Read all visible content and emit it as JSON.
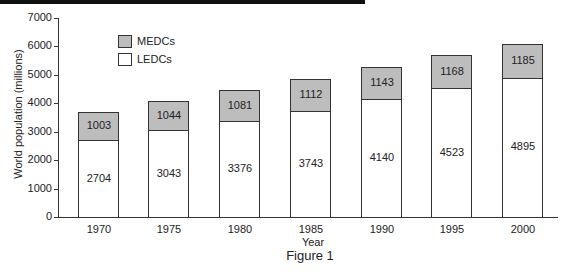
{
  "chart_data": {
    "type": "bar",
    "stacked": true,
    "title": "Figure 1",
    "xlabel": "Year",
    "ylabel": "World population (millions)",
    "ylim": [
      0,
      7000
    ],
    "yticks": [
      "0",
      "1000",
      "2000",
      "3000",
      "4000",
      "5000",
      "6000",
      "7000"
    ],
    "categories": [
      "1970",
      "1975",
      "1980",
      "1985",
      "1990",
      "1995",
      "2000"
    ],
    "series": [
      {
        "name": "LEDCs",
        "color": "#ffffff",
        "values": [
          2704,
          3043,
          3376,
          3743,
          4140,
          4523,
          4895
        ]
      },
      {
        "name": "MEDCs",
        "color": "#bdbdbd",
        "values": [
          1003,
          1044,
          1081,
          1112,
          1143,
          1168,
          1185
        ]
      }
    ],
    "legend": [
      "MEDCs",
      "LEDCs"
    ],
    "legend_position": "upper-left inside",
    "grid": false
  },
  "labels": {
    "figure": "Figure 1",
    "xlabel": "Year",
    "ylabel": "World population (millions)",
    "legend_medc": "MEDCs",
    "legend_ledc": "LEDCs"
  }
}
